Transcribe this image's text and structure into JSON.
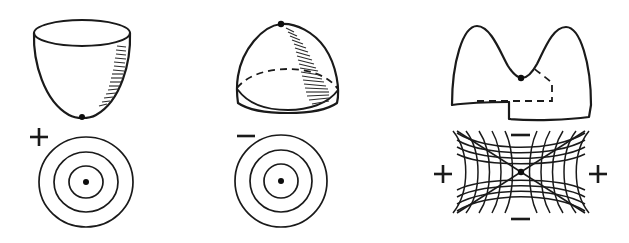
{
  "figure": {
    "background_color": "#ffffff",
    "ink_color": "#1a1a1a",
    "width": 629,
    "height": 243,
    "panels": [
      {
        "id": "minimum",
        "surface_name": "bowl-surface",
        "surface_type": "paraboloid-opening-upward",
        "critical_point_type": "local minimum",
        "critical_point_label": "bowl-bottom-point",
        "sign_label": "+",
        "sign_name": "plus-sign",
        "contour_type": "concentric-circles",
        "contour_count": 3,
        "contour_center_label": "center-dot",
        "rim_style": "solid-ellipse-open-top",
        "hidden_edge_style": "none",
        "shading": "hatched-right-side"
      },
      {
        "id": "maximum",
        "surface_name": "dome-surface",
        "surface_type": "paraboloid-opening-downward",
        "critical_point_type": "local maximum",
        "critical_point_label": "dome-apex-point",
        "sign_label": "−",
        "sign_name": "minus-sign",
        "contour_type": "concentric-circles",
        "contour_count": 3,
        "contour_center_label": "center-dot",
        "rim_style": "solid-front-arc",
        "hidden_edge_style": "dashed-back-arc",
        "shading": "hatched-right-side"
      },
      {
        "id": "saddle",
        "surface_name": "saddle-surface",
        "surface_type": "hyperbolic-paraboloid",
        "critical_point_type": "saddle point",
        "critical_point_label": "saddle-point",
        "contour_type": "hyperbolas-with-asymptotes",
        "contour_count": 12,
        "hidden_edge_style": "dashed-back-edge",
        "shading": "none",
        "region_signs": [
          {
            "name": "minus-sign-top",
            "label": "−",
            "position": "top"
          },
          {
            "name": "plus-sign-left",
            "label": "+",
            "position": "left"
          },
          {
            "name": "plus-sign-right",
            "label": "+",
            "position": "right"
          },
          {
            "name": "minus-sign-bottom",
            "label": "−",
            "position": "bottom"
          }
        ]
      }
    ]
  }
}
